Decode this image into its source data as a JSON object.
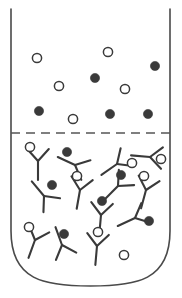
{
  "figure": {
    "title": "Immunoassay reaction tube",
    "width": 182,
    "height": 298,
    "background_color": "#ffffff"
  },
  "colors": {
    "vessel_stroke": "#4a4a4a",
    "divider_stroke": "#555555",
    "antibody_stroke": "#3a3a3a",
    "marker_open_fill": "#ffffff",
    "marker_open_stroke": "#3a3a3a",
    "marker_filled_fill": "#3a3a3a"
  },
  "vessel": {
    "left_wall_x": 11,
    "right_wall_x": 170,
    "top_y": 9,
    "straight_bottom_y": 231,
    "bottom_y": 286,
    "corner_radius": 80,
    "stroke_width": 1.6
  },
  "divider": {
    "y": 133,
    "x_start": 11,
    "x_end": 170,
    "style": "dashed",
    "dash_pattern": "9 6",
    "stroke_width": 1.5
  },
  "upper_zone": {
    "label": "free analyte zone",
    "marker_radius": 4.6,
    "markers": [
      {
        "type": "open",
        "cx": 37,
        "cy": 58
      },
      {
        "type": "open",
        "cx": 108,
        "cy": 52
      },
      {
        "type": "filled",
        "cx": 155,
        "cy": 66
      },
      {
        "type": "filled",
        "cx": 95,
        "cy": 78
      },
      {
        "type": "open",
        "cx": 59,
        "cy": 86
      },
      {
        "type": "open",
        "cx": 125,
        "cy": 89
      },
      {
        "type": "filled",
        "cx": 39,
        "cy": 111
      },
      {
        "type": "open",
        "cx": 73,
        "cy": 119
      },
      {
        "type": "filled",
        "cx": 110,
        "cy": 114
      },
      {
        "type": "filled",
        "cx": 148,
        "cy": 114
      }
    ]
  },
  "lower_zone": {
    "label": "bound antibody zone",
    "marker_radius": 4.6,
    "antibody_arm_length": 15,
    "antibody_stem_length": 19,
    "antibodies": [
      {
        "id": "ab-1",
        "x": 38,
        "y": 161,
        "rotation": 0,
        "marker": {
          "type": "open",
          "dx": -8,
          "dy": -14
        }
      },
      {
        "id": "ab-2",
        "x": 75,
        "y": 165,
        "rotation": 115,
        "marker": {
          "type": "filled",
          "dx": -8,
          "dy": -13
        }
      },
      {
        "id": "ab-3",
        "x": 117,
        "y": 164,
        "rotation": 55,
        "marker": {
          "type": "open",
          "dx": 15,
          "dy": -1
        }
      },
      {
        "id": "ab-4",
        "x": 150,
        "y": 157,
        "rotation": 95,
        "marker": {
          "type": "open",
          "dx": 11,
          "dy": 2
        }
      },
      {
        "id": "ab-5",
        "x": 44,
        "y": 196,
        "rotation": 140,
        "marker": {
          "type": "filled",
          "dx": 8,
          "dy": -11
        }
      },
      {
        "id": "ab-6",
        "x": 80,
        "y": 190,
        "rotation": 10,
        "marker": {
          "type": "open",
          "dx": -3,
          "dy": -14
        }
      },
      {
        "id": "ab-7",
        "x": 118,
        "y": 186,
        "rotation": 45,
        "marker": {
          "type": "filled",
          "dx": 3,
          "dy": -11
        }
      },
      {
        "id": "ab-8",
        "x": 146,
        "y": 190,
        "rotation": 15,
        "marker": {
          "type": "open",
          "dx": -2,
          "dy": -14
        }
      },
      {
        "id": "ab-9",
        "x": 101,
        "y": 215,
        "rotation": 5,
        "marker": {
          "type": "filled",
          "dx": 1,
          "dy": -14
        }
      },
      {
        "id": "ab-10",
        "x": 135,
        "y": 218,
        "rotation": 65,
        "marker": {
          "type": "filled",
          "dx": 14,
          "dy": 3
        }
      },
      {
        "id": "ab-11",
        "x": 35,
        "y": 240,
        "rotation": 20,
        "marker": {
          "type": "open",
          "dx": -6,
          "dy": -13
        }
      },
      {
        "id": "ab-12",
        "x": 62,
        "y": 245,
        "rotation": 160,
        "marker": {
          "type": "filled",
          "dx": 2,
          "dy": -11
        }
      },
      {
        "id": "ab-13",
        "x": 97,
        "y": 246,
        "rotation": 5,
        "marker": {
          "type": "open",
          "dx": 1,
          "dy": -14
        }
      }
    ],
    "free_markers": [
      {
        "type": "open",
        "cx": 124,
        "cy": 255
      }
    ]
  }
}
